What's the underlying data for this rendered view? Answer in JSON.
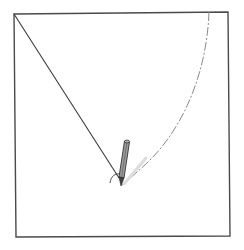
{
  "diagram": {
    "colors": {
      "outline": "#4a4a4a",
      "string": "#3a3a3a",
      "arc": "#8a8a8a",
      "pencil_body": "#6a6a6a",
      "pencil_shadow": "#d8d8d8"
    },
    "square": {
      "top_left": [
        14,
        14
      ],
      "top_right": [
        228,
        12
      ],
      "bottom_right": [
        230,
        236
      ],
      "bottom_left": [
        16,
        237
      ]
    },
    "pivot": [
      14,
      14
    ],
    "string_end": [
      119,
      178
    ],
    "pencil": {
      "top": [
        127,
        141
      ],
      "tip": [
        121,
        186
      ]
    },
    "arc": {
      "start": [
        209,
        12
      ],
      "end": [
        122,
        185
      ],
      "style": "dash-dot"
    }
  }
}
